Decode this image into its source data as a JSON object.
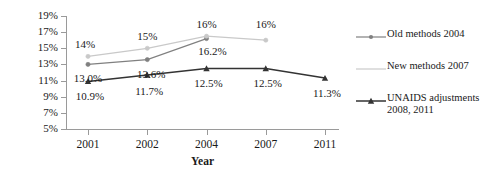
{
  "chart_data": {
    "type": "line",
    "title": "",
    "xlabel": "Year",
    "ylabel": "HIV prevalence",
    "categories": [
      "2001",
      "2002",
      "2004",
      "2007",
      "2011"
    ],
    "ylim": [
      5,
      19
    ],
    "ytick_labels": [
      "19%",
      "17%",
      "15%",
      "13%",
      "11%",
      "9%",
      "7%",
      "5%"
    ],
    "ytick_values": [
      19,
      17,
      15,
      13,
      11,
      9,
      7,
      5
    ],
    "grid": false,
    "legend_position": "right",
    "series": [
      {
        "name": "Old methods 2004",
        "color": "#808080",
        "marker": "circle",
        "x": [
          "2001",
          "2002",
          "2004"
        ],
        "values": [
          13.0,
          13.6,
          16.2
        ],
        "labels": [
          "13.0%",
          "13.6%",
          "16.2%"
        ]
      },
      {
        "name": "New methods 2007",
        "color": "#c9c9c9",
        "marker": "circle",
        "x": [
          "2001",
          "2002",
          "2004",
          "2007"
        ],
        "values": [
          14.0,
          15.0,
          16.5,
          16.0
        ],
        "labels": [
          "14%",
          "15%",
          "16%",
          "16%"
        ]
      },
      {
        "name": "UNAIDS adjustments 2008, 2011",
        "color": "#333333",
        "marker": "triangle",
        "x": [
          "2001",
          "2002",
          "2004",
          "2007",
          "2011"
        ],
        "values": [
          10.9,
          11.7,
          12.5,
          12.5,
          11.3
        ],
        "labels": [
          "10.9%",
          "11.7%",
          "12.5%",
          "12.5%",
          "11.3%"
        ]
      }
    ]
  },
  "axes": {
    "y_title": "HIV prevalence",
    "x_title": "Year",
    "y_labels": [
      "19%",
      "17%",
      "15%",
      "13%",
      "11%",
      "9%",
      "7%",
      "5%"
    ],
    "x_labels": [
      "2001",
      "2002",
      "2004",
      "2007",
      "2011"
    ]
  },
  "data_labels": {
    "old_2001": "13.0%",
    "old_2002": "13.6%",
    "old_2004": "16.2%",
    "new_2001": "14%",
    "new_2002": "15%",
    "new_2004": "16%",
    "new_2007": "16%",
    "unaids_2001": "10.9%",
    "unaids_2002": "11.7%",
    "unaids_2004": "12.5%",
    "unaids_2007": "12.5%",
    "unaids_2011": "11.3%"
  },
  "legend": {
    "items": [
      {
        "label": "Old methods 2004",
        "color": "#808080",
        "marker": "circle"
      },
      {
        "label": "New methods 2007",
        "color": "#c9c9c9",
        "marker": "none"
      },
      {
        "label": "UNAIDS adjustments\n2008, 2011",
        "color": "#333333",
        "marker": "triangle"
      }
    ]
  },
  "colors": {
    "old_methods": "#808080",
    "new_methods": "#c9c9c9",
    "unaids": "#333333",
    "axis": "#9a9a9a",
    "text": "#1a1a1a",
    "background": "#ffffff"
  }
}
